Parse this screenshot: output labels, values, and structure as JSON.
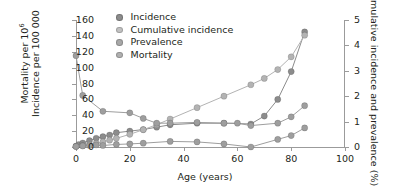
{
  "chart_data": {
    "type": "line",
    "title": "",
    "xlabel": "Age (years)",
    "ylabel_left": "Mortality per 10⁶  Incidence per 100 000",
    "ylabel_right": "Cumulative incidence and prevalence (%)",
    "xlim": [
      0,
      100
    ],
    "ylim_left": [
      0,
      160
    ],
    "ylim_right": [
      0,
      5
    ],
    "xticks": [
      0,
      20,
      40,
      60,
      80,
      100
    ],
    "yticks_left": [
      0,
      20,
      40,
      60,
      80,
      100,
      120,
      140,
      160
    ],
    "yticks_right": [
      0,
      1,
      2,
      3,
      4,
      5
    ],
    "grid": false,
    "legend_position": "top-center",
    "series": [
      {
        "name": "Incidence",
        "axis": "left",
        "color": "#8c8c8c",
        "x": [
          0,
          1,
          2.5,
          5,
          7.5,
          10,
          12.5,
          15,
          20,
          25,
          30,
          35,
          45,
          55,
          65,
          70,
          75,
          80,
          85
        ],
        "values": [
          1,
          3,
          5,
          8,
          11,
          13,
          15,
          18,
          20,
          22,
          25,
          28,
          30,
          30,
          29,
          39,
          60,
          95,
          145
        ]
      },
      {
        "name": "Cumulative incidence",
        "axis": "right",
        "color": "#b3b3b3",
        "x": [
          0,
          2.5,
          5,
          7.5,
          10,
          12.5,
          15,
          20,
          25,
          30,
          35,
          45,
          55,
          65,
          70,
          75,
          80,
          85
        ],
        "values": [
          0.02,
          0.05,
          0.09,
          0.14,
          0.2,
          0.27,
          0.34,
          0.5,
          0.68,
          0.88,
          1.1,
          1.55,
          2.0,
          2.45,
          2.7,
          3.05,
          3.55,
          4.4
        ]
      },
      {
        "name": "Prevalence",
        "axis": "right",
        "color": "#9e9e9e",
        "x": [
          0,
          2.5,
          5,
          7.5,
          10,
          15,
          20,
          25,
          35,
          45,
          55,
          65,
          75,
          80,
          85
        ],
        "values": [
          0.02,
          0.04,
          0.06,
          0.08,
          0.06,
          0.1,
          0.12,
          0.15,
          0.22,
          0.2,
          0.12,
          0.0,
          0.3,
          0.45,
          0.75
        ]
      },
      {
        "name": "Mortality",
        "axis": "left",
        "color": "#9e9e9e",
        "x": [
          0,
          2.5,
          10,
          20,
          25,
          30,
          35,
          45,
          55,
          60,
          65,
          75,
          80,
          85
        ],
        "values": [
          115,
          65,
          45,
          43,
          36,
          30,
          30,
          31,
          30,
          30,
          27,
          30,
          38,
          52
        ]
      }
    ]
  },
  "legend": {
    "items": [
      {
        "label": "Incidence",
        "color": "#8c8c8c"
      },
      {
        "label": "Cumulative incidence",
        "color": "#c2c2c2"
      },
      {
        "label": "Prevalence",
        "color": "#a8a8a8"
      },
      {
        "label": "Mortality",
        "color": "#b0b0b0"
      }
    ]
  },
  "axes": {
    "x": {
      "label": "Age (years)",
      "ticks": [
        "0",
        "20",
        "40",
        "60",
        "80",
        "100"
      ]
    },
    "y_left": {
      "label_line1": "Mortality per 10",
      "label_sup": "6",
      "label_line2": "Incidence per 100 000",
      "ticks": [
        "0",
        "20",
        "40",
        "60",
        "80",
        "100",
        "120",
        "140",
        "160"
      ]
    },
    "y_right": {
      "label": "Cumulative incidence and prevalence (%)",
      "ticks": [
        "0",
        "1",
        "2",
        "3",
        "4",
        "5"
      ]
    }
  },
  "colors": {
    "axis": "#9b9b9b",
    "text": "#231f20",
    "background": "#ffffff"
  }
}
